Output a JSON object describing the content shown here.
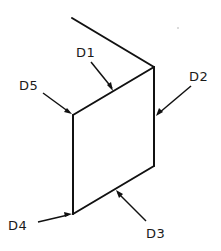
{
  "diagram": {
    "type": "isometric-panel-dimension-drawing",
    "labels": {
      "d1": "D1",
      "d2": "D2",
      "d3": "D3",
      "d4": "D4",
      "d5": "D5"
    },
    "colors": {
      "line": "#111111",
      "background": "#ffffff"
    }
  }
}
